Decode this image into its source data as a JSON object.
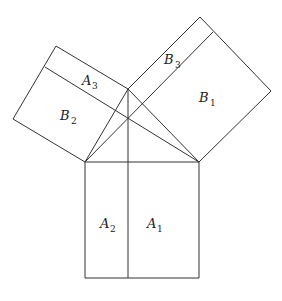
{
  "diagram": {
    "labels": [
      {
        "id": "A1",
        "letter": "A",
        "sub": "1",
        "x": 150,
        "y": 226
      },
      {
        "id": "A2",
        "letter": "A",
        "sub": "2",
        "x": 100,
        "y": 226
      },
      {
        "id": "A3",
        "letter": "A",
        "sub": "3",
        "x": 82,
        "y": 84
      },
      {
        "id": "B1",
        "letter": "B",
        "sub": "1",
        "x": 200,
        "y": 104
      },
      {
        "id": "B2",
        "letter": "B",
        "sub": "2",
        "x": 60,
        "y": 122
      },
      {
        "id": "B3",
        "letter": "B",
        "sub": "3",
        "x": 165,
        "y": 65
      }
    ],
    "colors": {
      "stroke": "#333333",
      "background": "#ffffff",
      "text": "#222222"
    }
  }
}
